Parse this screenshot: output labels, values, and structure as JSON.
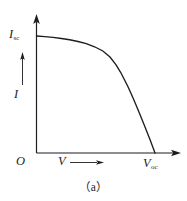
{
  "figure": {
    "caption": "（a）",
    "background_color": "#ffffff",
    "line_color": "#1d1d1d"
  },
  "labels": {
    "y_max_symbol": "I",
    "y_max_subscript": "sc",
    "y_axis_symbol": "I",
    "origin_symbol": "O",
    "x_axis_symbol": "V",
    "x_max_symbol": "V",
    "x_max_subscript": "oc"
  },
  "chart_data": {
    "type": "line",
    "title": "",
    "subtitle": "",
    "xlabel": "V",
    "ylabel": "I",
    "grid": false,
    "legend": null,
    "axis_arrows": {
      "x": "right",
      "y": "up"
    },
    "xlim": [
      0,
      1.12
    ],
    "ylim": [
      0,
      1.12
    ],
    "annotations": [
      {
        "text": "I",
        "sub": "sc",
        "at": [
          0,
          1.0
        ],
        "position": "left-of-axis"
      },
      {
        "text": "I",
        "at": [
          0,
          0.46
        ],
        "position": "left-of-axis",
        "arrow": "up"
      },
      {
        "text": "O",
        "at": [
          0,
          0
        ],
        "position": "below-left-of-origin"
      },
      {
        "text": "V",
        "at": [
          0.3,
          0
        ],
        "position": "below-axis",
        "arrow": "right"
      },
      {
        "text": "V",
        "sub": "oc",
        "at": [
          1.0,
          0
        ],
        "position": "below-axis"
      }
    ],
    "series": [
      {
        "name": "I-V characteristic",
        "x": [
          0.0,
          0.07,
          0.14,
          0.21,
          0.28,
          0.35,
          0.42,
          0.49,
          0.56,
          0.62,
          0.67,
          0.71,
          0.74,
          0.77,
          0.8,
          0.84,
          0.88,
          0.92,
          0.96,
          1.0
        ],
        "y": [
          1.0,
          0.995,
          0.988,
          0.979,
          0.968,
          0.953,
          0.934,
          0.908,
          0.872,
          0.82,
          0.755,
          0.69,
          0.63,
          0.57,
          0.505,
          0.41,
          0.312,
          0.212,
          0.108,
          0.0
        ]
      }
    ]
  }
}
